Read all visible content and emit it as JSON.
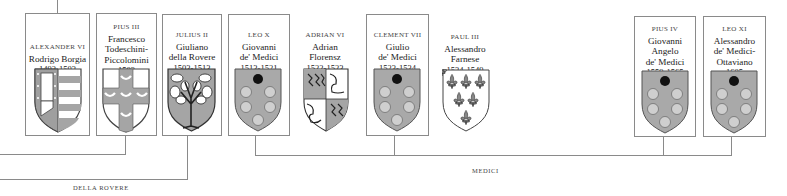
{
  "diagram": {
    "popes": [
      {
        "id": "alexander-vi",
        "title": "ALEXANDER VI",
        "name_lines": [
          "Rodrigo Borgia"
        ],
        "years": "1492-1503",
        "boxed": true,
        "arms": "borgia"
      },
      {
        "id": "pius-iii",
        "title": "PIUS III",
        "name_lines": [
          "Francesco",
          "Todeschini-",
          "Piccolomini"
        ],
        "years": "1503",
        "boxed": true,
        "arms": "piccolomini"
      },
      {
        "id": "julius-ii",
        "title": "JULIUS II",
        "name_lines": [
          "Giuliano",
          "della Rovere"
        ],
        "years": "1503-1513",
        "boxed": true,
        "arms": "della-rovere"
      },
      {
        "id": "leo-x",
        "title": "LEO X",
        "name_lines": [
          "Giovanni",
          "de' Medici"
        ],
        "years": "1513-1521",
        "boxed": true,
        "arms": "medici"
      },
      {
        "id": "adrian-vi",
        "title": "ADRIAN VI",
        "name_lines": [
          "Adrian",
          "Florensz"
        ],
        "years": "1522-1523",
        "boxed": false,
        "arms": "adrian"
      },
      {
        "id": "clement-vii",
        "title": "CLEMENT VII",
        "name_lines": [
          "Giulio",
          "de' Medici"
        ],
        "years": "1523-1534",
        "boxed": true,
        "arms": "medici"
      },
      {
        "id": "paul-iii",
        "title": "PAUL III",
        "name_lines": [
          "Alessandro",
          "Farnese"
        ],
        "years": "1534-1549",
        "boxed": false,
        "arms": "farnese"
      },
      {
        "id": "pius-iv",
        "title": "PIUS IV",
        "name_lines": [
          "Giovanni",
          "Angelo",
          "de' Medici"
        ],
        "years": "1559-1565",
        "boxed": true,
        "arms": "medici"
      },
      {
        "id": "leo-xi",
        "title": "LEO XI",
        "name_lines": [
          "Alessandro",
          "de' Medici-",
          "Ottaviano"
        ],
        "years": "1605",
        "boxed": true,
        "arms": "medici"
      }
    ],
    "families": [
      {
        "label": "DELLA ROVERE"
      },
      {
        "label": "MEDICI"
      }
    ],
    "colors": {
      "line": "#8a8a8a",
      "medici_field": "#a9a9a9",
      "medici_ball": "#cfcfcf",
      "medici_top_ball": "#111111",
      "borgia_field": "#a0a0a0"
    }
  }
}
